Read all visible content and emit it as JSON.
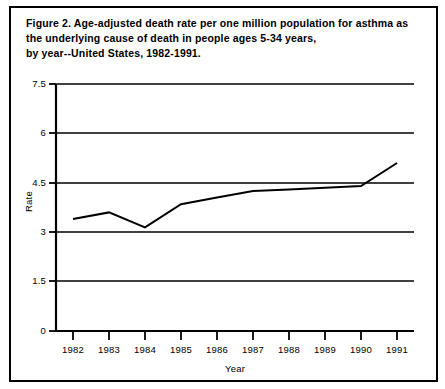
{
  "figure": {
    "caption": "Figure 2.  Age-adjusted death rate per one million population for asthma as the underlying cause of death in people ages 5-34 years,\nby year--United States, 1982-1991."
  },
  "chart_data": {
    "type": "line",
    "title": "",
    "xlabel": "Year",
    "ylabel": "Rate",
    "categories": [
      "1982",
      "1983",
      "1984",
      "1985",
      "1986",
      "1987",
      "1988",
      "1989",
      "1990",
      "1991"
    ],
    "x": [
      1982,
      1983,
      1984,
      1985,
      1986,
      1987,
      1988,
      1989,
      1990,
      1991
    ],
    "values": [
      3.4,
      3.6,
      3.15,
      3.85,
      4.05,
      4.25,
      4.3,
      4.35,
      4.4,
      5.1
    ],
    "series": [
      {
        "name": "Asthma death rate",
        "values": [
          3.4,
          3.6,
          3.15,
          3.85,
          4.05,
          4.25,
          4.3,
          4.35,
          4.4,
          5.1
        ]
      }
    ],
    "ylim": [
      0,
      7.5
    ],
    "yticks": [
      0,
      1.5,
      3,
      4.5,
      6,
      7.5
    ],
    "ytick_labels": [
      "0",
      "1.5",
      "3",
      "4.5",
      "6",
      "7.5"
    ],
    "xlim": [
      1981.5,
      1991.5
    ],
    "grid": "horizontal",
    "legend": "none",
    "line_color": "#000000",
    "line_width": 2,
    "markers": "none",
    "axis_color": "#000000",
    "background": "#ffffff"
  }
}
